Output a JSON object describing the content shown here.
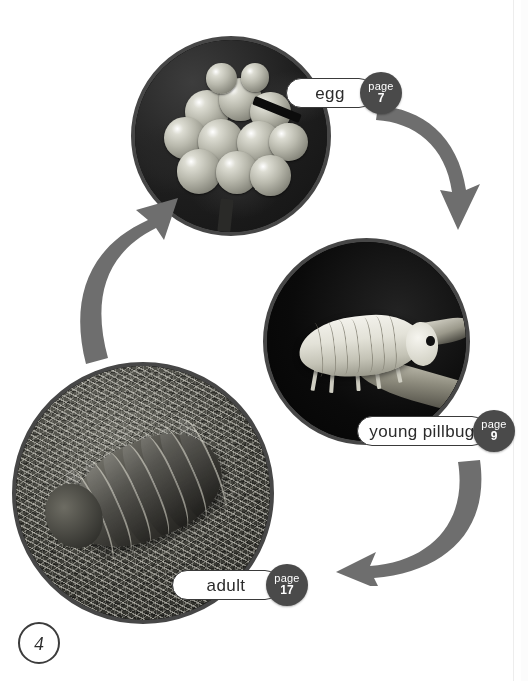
{
  "page": {
    "folio_number": "4",
    "background_color": "#ffffff",
    "type": "life-cycle-diagram"
  },
  "stages": [
    {
      "id": "egg",
      "label": "egg",
      "page_word": "page",
      "page_number": "7",
      "photo_alt": "cluster of translucent pillbug eggs",
      "badge_color": "#4a4a4a",
      "ring_color": "#474747"
    },
    {
      "id": "young-pillbug",
      "label": "young pillbug",
      "page_word": "page",
      "page_number": "9",
      "photo_alt": "pale young pillbug on dark background",
      "badge_color": "#4a4a4a",
      "ring_color": "#474747"
    },
    {
      "id": "adult",
      "label": "adult",
      "page_word": "page",
      "page_number": "17",
      "photo_alt": "adult pillbug with segmented plates on moss",
      "badge_color": "#4a4a4a",
      "ring_color": "#474747"
    }
  ],
  "arrows": [
    {
      "id": "egg-to-young",
      "direction": "down-right",
      "color": "#6e6e6e"
    },
    {
      "id": "young-to-adult",
      "direction": "down-left",
      "color": "#6e6e6e"
    },
    {
      "id": "adult-to-egg",
      "direction": "up-right",
      "color": "#6e6e6e"
    }
  ]
}
